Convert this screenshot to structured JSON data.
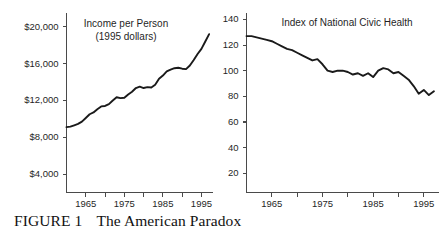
{
  "figure": {
    "caption_label": "FIGURE 1",
    "caption_title": "The American Paradox",
    "background_color": "#ffffff",
    "line_color": "#1a1a1a",
    "axis_color": "#4a4a4a"
  },
  "chart_data": [
    {
      "type": "line",
      "id": "income-per-person",
      "title": "Income per Person",
      "subtitle": "(1995 dollars)",
      "xlabel": "",
      "ylabel": "",
      "grid": false,
      "legend": "none",
      "xlim": [
        1960,
        1998
      ],
      "ylim": [
        2000,
        21500
      ],
      "ytick_values": [
        4000,
        8000,
        12000,
        16000,
        20000
      ],
      "ytick_labels": [
        "$4,000",
        "$8,000",
        "$12,000",
        "$16,000",
        "$20,000"
      ],
      "xtick_values": [
        1965,
        1970,
        1975,
        1980,
        1985,
        1990,
        1995
      ],
      "xtick_labels": [
        "1965",
        "",
        "1975",
        "",
        "1985",
        "",
        "1995"
      ],
      "x": [
        1960,
        1961,
        1962,
        1963,
        1964,
        1965,
        1966,
        1967,
        1968,
        1969,
        1970,
        1971,
        1972,
        1973,
        1974,
        1975,
        1976,
        1977,
        1978,
        1979,
        1980,
        1981,
        1982,
        1983,
        1984,
        1985,
        1986,
        1987,
        1988,
        1989,
        1990,
        1991,
        1992,
        1993,
        1994,
        1995,
        1996,
        1997
      ],
      "values": [
        9100,
        9150,
        9300,
        9450,
        9700,
        10100,
        10500,
        10700,
        11050,
        11350,
        11400,
        11600,
        12000,
        12350,
        12250,
        12300,
        12650,
        12950,
        13350,
        13500,
        13350,
        13450,
        13400,
        13700,
        14350,
        14700,
        15150,
        15350,
        15500,
        15550,
        15450,
        15400,
        15800,
        16400,
        17050,
        17600,
        18400,
        19200
      ],
      "series_name": "Income per Person (1995 dollars)"
    },
    {
      "type": "line",
      "id": "index-of-national-civic-health",
      "title": "Index of National Civic Health",
      "subtitle": "",
      "xlabel": "",
      "ylabel": "",
      "grid": false,
      "legend": "none",
      "xlim": [
        1960,
        1998
      ],
      "ylim": [
        5,
        145
      ],
      "ytick_values": [
        20,
        40,
        60,
        80,
        100,
        120,
        140
      ],
      "ytick_labels": [
        "20",
        "40",
        "60",
        "80",
        "100",
        "120",
        "140"
      ],
      "xtick_values": [
        1965,
        1970,
        1975,
        1980,
        1985,
        1990,
        1995
      ],
      "xtick_labels": [
        "1965",
        "",
        "1975",
        "",
        "1985",
        "",
        "1995"
      ],
      "x": [
        1960,
        1961,
        1962,
        1963,
        1964,
        1965,
        1966,
        1967,
        1968,
        1969,
        1970,
        1971,
        1972,
        1973,
        1974,
        1975,
        1976,
        1977,
        1978,
        1979,
        1980,
        1981,
        1982,
        1983,
        1984,
        1985,
        1986,
        1987,
        1988,
        1989,
        1990,
        1991,
        1992,
        1993,
        1994,
        1995,
        1996,
        1997
      ],
      "values": [
        127,
        127,
        126,
        125,
        124,
        123,
        121,
        119,
        117,
        116,
        114,
        112,
        110,
        108,
        109,
        105,
        100,
        99,
        100,
        100,
        99,
        97,
        98,
        96,
        98,
        95,
        100,
        102,
        101,
        98,
        99,
        96,
        93,
        88,
        82,
        85,
        81,
        84
      ],
      "series_name": "Index of National Civic Health"
    }
  ]
}
